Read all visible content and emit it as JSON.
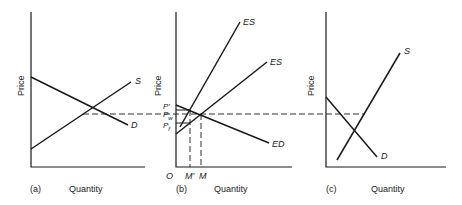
{
  "figure": {
    "panels": [
      {
        "id": "a",
        "tag": "(a)",
        "xlabel": "Quantity",
        "ylabel": "Price",
        "curves": [
          {
            "name": "S"
          },
          {
            "name": "D"
          }
        ]
      },
      {
        "id": "b",
        "tag": "(b)",
        "xlabel": "Quantity",
        "ylabel": "Price",
        "curves": [
          {
            "name": "ES"
          },
          {
            "name": "ES"
          },
          {
            "name": "ED"
          }
        ],
        "price_ticks": [
          "P'",
          "P",
          "P"
        ],
        "price_subscripts": [
          "",
          "w",
          "f"
        ],
        "quantity_ticks": [
          "O",
          "M'",
          "M"
        ]
      },
      {
        "id": "c",
        "tag": "(c)",
        "xlabel": "Quantity",
        "ylabel": "Price",
        "curves": [
          {
            "name": "S"
          },
          {
            "name": "D"
          }
        ]
      }
    ],
    "colors": {
      "line": "#1a1a1a",
      "background": "#ffffff"
    }
  }
}
